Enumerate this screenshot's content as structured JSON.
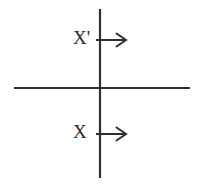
{
  "figure": {
    "background_color": "#ffffff",
    "line_color": "#2f2f2f",
    "text_color": "#2a2a2a",
    "width": 199,
    "height": 187,
    "axes": {
      "vertical": {
        "name": "vertical-axis",
        "x": 100,
        "y_start": 9,
        "y_end": 178
      },
      "horizontal": {
        "name": "horizontal-axis",
        "y": 88,
        "x_start": 14,
        "x_end": 190
      },
      "origin": {
        "x": 100,
        "y": 88
      }
    },
    "vectors": [
      {
        "id": "upper",
        "label": "X'",
        "label_text": "X",
        "prime": "'",
        "direction": "right",
        "arrowhead": "open-chevron",
        "y": 40,
        "x_start": 96,
        "x_tip": 126
      },
      {
        "id": "lower",
        "label": "X",
        "label_text": "X",
        "prime": "",
        "direction": "right",
        "arrowhead": "open-chevron",
        "y": 134,
        "x_start": 96,
        "x_tip": 126
      }
    ]
  }
}
